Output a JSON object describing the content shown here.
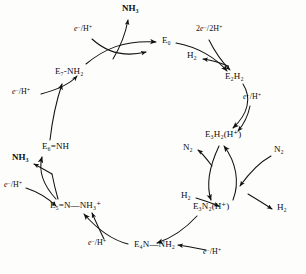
{
  "diagram": {
    "stroke_color": "#111111",
    "background_color": "#fdfdfb",
    "width": 306,
    "height": 274
  },
  "nodes": [
    {
      "id": "E0",
      "label": "E₀",
      "x": 162,
      "y": 41,
      "align": "left"
    },
    {
      "id": "E2H2",
      "label": "E₂H₂",
      "x": 225,
      "y": 77,
      "align": "left"
    },
    {
      "id": "E3H2",
      "label": "E₃H₂(H⁺)",
      "x": 205,
      "y": 135,
      "align": "left"
    },
    {
      "id": "E3N2",
      "label": "E₃N₂(H⁺)",
      "x": 193,
      "y": 207,
      "align": "left"
    },
    {
      "id": "E4NNH2",
      "label": "E₄N—NH₂",
      "x": 134,
      "y": 245,
      "align": "left"
    },
    {
      "id": "E5NNH3",
      "label": "E₅=N—NH₃⁺",
      "x": 50,
      "y": 206,
      "align": "left"
    },
    {
      "id": "E6NH",
      "label": "E₆=NH",
      "x": 42,
      "y": 147,
      "align": "left"
    },
    {
      "id": "E7NH2",
      "label": "E₇-NH₂",
      "x": 55,
      "y": 72,
      "align": "left"
    }
  ],
  "reagents": [
    {
      "id": "e-h-top-left",
      "label_html": "<i>e</i><sup>−</sup>/H<sup>+</sup>",
      "x": 74,
      "y": 30
    },
    {
      "id": "e-h-mid-left",
      "label_html": "<i>e</i><sup>−</sup>/H<sup>+</sup>",
      "x": 12,
      "y": 93
    },
    {
      "id": "e-h-lower-left",
      "label_html": "<i>e</i><sup>−</sup>/H<sup>+</sup>",
      "x": 4,
      "y": 186
    },
    {
      "id": "e-h-bottom-left",
      "label_html": "<i>e</i><sup>−</sup>/H<sup>+</sup>",
      "x": 88,
      "y": 244
    },
    {
      "id": "e-h-bottom-right",
      "label_html": "<i>e</i><sup>−</sup>/H<sup>+</sup>",
      "x": 203,
      "y": 253
    },
    {
      "id": "two-e-two-h",
      "label_html": "2<i>e</i><sup>−</sup>/2H<sup>+</sup>",
      "x": 196,
      "y": 30
    },
    {
      "id": "e-h-right",
      "label_html": "<i>e</i><sup>−</sup>/H<sup>+</sup>",
      "x": 243,
      "y": 98
    }
  ],
  "products": [
    {
      "id": "nh3-top",
      "label": "NH₃",
      "x": 122,
      "y": 8,
      "bold": true
    },
    {
      "id": "nh3-left",
      "label": "NH₃",
      "x": 12,
      "y": 158,
      "bold": true
    },
    {
      "id": "h2-out-top",
      "label": "H₂",
      "x": 187,
      "y": 56,
      "bold": false
    },
    {
      "id": "n2-out",
      "label": "N₂",
      "x": 183,
      "y": 148,
      "bold": false
    },
    {
      "id": "n2-in",
      "label": "N₂",
      "x": 274,
      "y": 150,
      "bold": false
    },
    {
      "id": "h2-in",
      "label": "H₂",
      "x": 181,
      "y": 196,
      "bold": false
    },
    {
      "id": "h2-out-bot",
      "label": "H₂",
      "x": 277,
      "y": 208,
      "bold": false
    }
  ],
  "arcs": [
    {
      "id": "arc-e7-to-e0",
      "from": "E7NH2",
      "to": "E0",
      "desc": "E7-NH2 to E0 around top-left"
    },
    {
      "id": "arc-e0-to-e2h2",
      "from": "E0",
      "to": "E2H2",
      "desc": "E0 to E2H2 across top-right"
    },
    {
      "id": "arc-e2h2-to-e3",
      "from": "E2H2",
      "to": "E3H2",
      "desc": "E2H2 down to E3H2(H+)"
    },
    {
      "id": "arc-e3h2-e3n2",
      "from": "E3H2",
      "to": "E3N2",
      "desc": "N2/H2 exchange crossing arcs"
    },
    {
      "id": "arc-e3n2-e4",
      "from": "E3N2",
      "to": "E4NNH2",
      "desc": "E3N2(H+) to E4N-NH2"
    },
    {
      "id": "arc-e4-e5",
      "from": "E4NNH2",
      "to": "E5NNH3",
      "desc": "E4N-NH2 to E5=N-NH3+"
    },
    {
      "id": "arc-e5-e6",
      "from": "E5NNH3",
      "to": "E6NH",
      "desc": "E5=N-NH3+ to E6=NH, NH3 released"
    },
    {
      "id": "arc-e6-e7",
      "from": "E6NH",
      "to": "E7NH2",
      "desc": "E6=NH up to E7-NH2"
    }
  ]
}
